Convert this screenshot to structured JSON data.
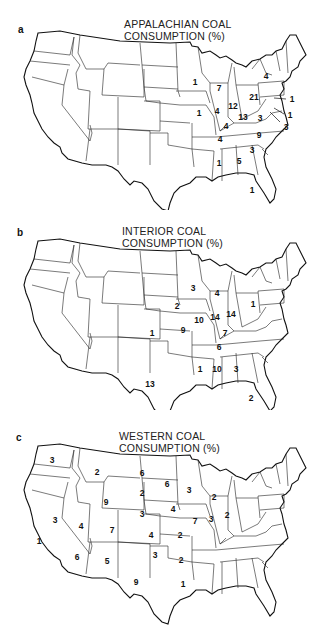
{
  "panels": [
    {
      "letter": "a",
      "title_line1": "APPALACHIAN COAL",
      "title_line2": "CONSUMPTION (%)",
      "values": [
        {
          "state": "Wisconsin",
          "value": "1"
        },
        {
          "state": "Michigan",
          "value": "7"
        },
        {
          "state": "New York",
          "value": "4"
        },
        {
          "state": "Pennsylvania",
          "value": "21"
        },
        {
          "state": "Illinois",
          "value": "1"
        },
        {
          "state": "Indiana",
          "value": "4"
        },
        {
          "state": "Ohio",
          "value": "12"
        },
        {
          "state": "West Virginia",
          "value": "13"
        },
        {
          "state": "Virginia",
          "value": "3"
        },
        {
          "state": "Kentucky",
          "value": "4"
        },
        {
          "state": "Tennessee",
          "value": "4"
        },
        {
          "state": "North Carolina",
          "value": "9"
        },
        {
          "state": "South Carolina",
          "value": "3"
        },
        {
          "state": "Alabama",
          "value": "1"
        },
        {
          "state": "Georgia",
          "value": "5"
        },
        {
          "state": "Florida",
          "value": "1"
        },
        {
          "state": "New Jersey",
          "value": "1"
        },
        {
          "state": "Delaware",
          "value": "1"
        },
        {
          "state": "Maryland",
          "value": "3"
        }
      ]
    },
    {
      "letter": "b",
      "title_line1": "INTERIOR COAL",
      "title_line2": "CONSUMPTION (%)",
      "values": [
        {
          "state": "Wisconsin",
          "value": "3"
        },
        {
          "state": "Michigan",
          "value": "4"
        },
        {
          "state": "Iowa",
          "value": "2"
        },
        {
          "state": "Pennsylvania",
          "value": "1"
        },
        {
          "state": "Illinois",
          "value": "10"
        },
        {
          "state": "Indiana",
          "value": "14"
        },
        {
          "state": "Ohio",
          "value": "14"
        },
        {
          "state": "Kansas",
          "value": "1"
        },
        {
          "state": "Missouri",
          "value": "9"
        },
        {
          "state": "Kentucky",
          "value": "7"
        },
        {
          "state": "Tennessee",
          "value": "6"
        },
        {
          "state": "Mississippi",
          "value": "1"
        },
        {
          "state": "Alabama",
          "value": "10"
        },
        {
          "state": "Georgia",
          "value": "3"
        },
        {
          "state": "Texas",
          "value": "13"
        },
        {
          "state": "Florida",
          "value": "2"
        }
      ]
    },
    {
      "letter": "c",
      "title_line1": "WESTERN COAL",
      "title_line2": "CONSUMPTION (%)",
      "values": [
        {
          "state": "Washington",
          "value": "3"
        },
        {
          "state": "Montana",
          "value": "2"
        },
        {
          "state": "North Dakota",
          "value": "6"
        },
        {
          "state": "Minnesota",
          "value": "6"
        },
        {
          "state": "Wisconsin",
          "value": "3"
        },
        {
          "state": "Michigan",
          "value": "2"
        },
        {
          "state": "South Dakota",
          "value": "2"
        },
        {
          "state": "Wyoming",
          "value": "9"
        },
        {
          "state": "Nebraska",
          "value": "3"
        },
        {
          "state": "Iowa",
          "value": "4"
        },
        {
          "state": "Nevada",
          "value": "3"
        },
        {
          "state": "Utah",
          "value": "4"
        },
        {
          "state": "Colorado",
          "value": "7"
        },
        {
          "state": "Illinois",
          "value": "7"
        },
        {
          "state": "Indiana",
          "value": "3"
        },
        {
          "state": "Ohio",
          "value": "2"
        },
        {
          "state": "California",
          "value": "1"
        },
        {
          "state": "Kansas",
          "value": "4"
        },
        {
          "state": "Missouri",
          "value": "2"
        },
        {
          "state": "Arizona",
          "value": "6"
        },
        {
          "state": "New Mexico",
          "value": "5"
        },
        {
          "state": "Oklahoma",
          "value": "3"
        },
        {
          "state": "Arkansas",
          "value": "2"
        },
        {
          "state": "Texas",
          "value": "9"
        },
        {
          "state": "Louisiana",
          "value": "1"
        }
      ]
    }
  ]
}
